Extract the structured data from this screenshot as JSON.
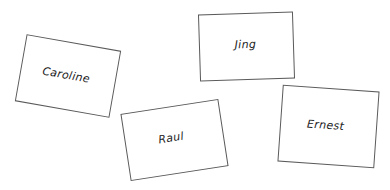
{
  "canvas": {
    "width": 390,
    "height": 190,
    "background_color": "#ffffff"
  },
  "style": {
    "card_fill": "#ffffff",
    "card_border_color": "#5a5a5a",
    "label_color": "#1d1d1d"
  },
  "cards": [
    {
      "id": "caroline",
      "label": "Caroline",
      "rotation_degrees": 10
    },
    {
      "id": "jing",
      "label": "Jing",
      "rotation_degrees": -1.8
    },
    {
      "id": "raul",
      "label": "Raul",
      "rotation_degrees": -8.7
    },
    {
      "id": "ernest",
      "label": "Ernest",
      "rotation_degrees": 4
    }
  ]
}
